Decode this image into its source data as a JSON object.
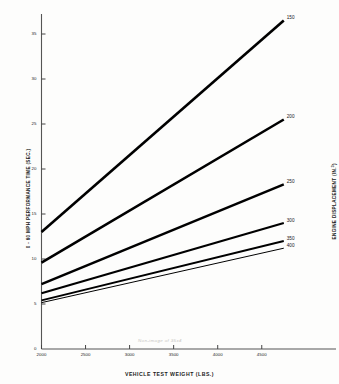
{
  "chart_data": {
    "type": "line",
    "title": "",
    "xlabel": "VEHICLE TEST WEIGHT (LBS.)",
    "ylabel": "0 - 60 MPH PERFORMANCE TIME (SEC.)",
    "ylabel_right": "ENGINE DISPLACEMENT (IN.",
    "ylabel_right_sup": "3",
    "ylabel_right_tail": ")",
    "xlim": [
      2000,
      4900
    ],
    "ylim": [
      0,
      37
    ],
    "grid": false,
    "legend_position": "line-end-labels",
    "xticks": [
      2000,
      2500,
      3000,
      3500,
      4000,
      4500
    ],
    "xtick_labels": [
      "2000",
      "2500",
      "3000",
      "3500",
      "4000",
      "4500"
    ],
    "yticks": [
      0,
      5,
      10,
      15,
      20,
      25,
      30,
      35
    ],
    "ytick_labels": [
      "0",
      "5",
      "10",
      "15",
      "20",
      "25",
      "30",
      "35"
    ],
    "x": [
      2000,
      4750
    ],
    "series": [
      {
        "name": "150",
        "label": "150",
        "values": [
          13.0,
          36.5
        ],
        "width": 2.6
      },
      {
        "name": "200",
        "label": "200",
        "values": [
          9.6,
          25.5
        ],
        "width": 2.6
      },
      {
        "name": "250",
        "label": "250",
        "values": [
          7.2,
          18.3
        ],
        "width": 2.4
      },
      {
        "name": "300",
        "label": "300",
        "values": [
          6.2,
          14.0
        ],
        "width": 2.2
      },
      {
        "name": "350",
        "label": "350",
        "values": [
          5.4,
          12.0
        ],
        "width": 2.0
      },
      {
        "name": "400",
        "label": "400",
        "values": [
          5.15,
          11.2
        ],
        "width": 1.0
      }
    ],
    "series_units": "in.^3 engine displacement",
    "line_color": "#000000"
  },
  "artifact_text": "Non-image of 35x4"
}
